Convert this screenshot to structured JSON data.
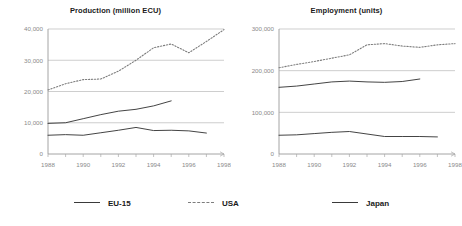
{
  "legend": {
    "items": [
      {
        "label": "EU-15",
        "style": "solid",
        "color": "#3a3a3a"
      },
      {
        "label": "USA",
        "style": "dotted",
        "color": "#7d7d7d"
      },
      {
        "label": "Japan",
        "style": "solid",
        "color": "#3a3a3a"
      }
    ]
  },
  "chart_data": [
    {
      "type": "line",
      "title": "Production (million ECU)",
      "xlabel": "",
      "ylabel": "",
      "xlim": [
        1988,
        1998
      ],
      "ylim": [
        0,
        40000
      ],
      "yticks": [
        0,
        10000,
        20000,
        30000,
        40000
      ],
      "ytick_labels": [
        "0",
        "10,000",
        "20,000",
        "30,000",
        "40,000"
      ],
      "xticks": [
        1988,
        1990,
        1992,
        1994,
        1996,
        1998
      ],
      "xtick_labels": [
        "1988",
        "1990",
        "1992",
        "1994",
        "1996",
        "1998"
      ],
      "grid": true,
      "legend_position": "bottom",
      "series": [
        {
          "name": "EU-15",
          "style": "solid",
          "color": "#3a3a3a",
          "x": [
            1988,
            1989,
            1990,
            1991,
            1992,
            1993,
            1994,
            1995
          ],
          "values": [
            9800,
            10000,
            11300,
            12600,
            13700,
            14300,
            15400,
            17000
          ]
        },
        {
          "name": "USA",
          "style": "dotted",
          "color": "#7d7d7d",
          "x": [
            1988,
            1989,
            1990,
            1991,
            1992,
            1993,
            1994,
            1995,
            1996,
            1997,
            1998
          ],
          "values": [
            20500,
            22500,
            23800,
            24000,
            26500,
            30000,
            34000,
            35200,
            32400,
            36000,
            39800
          ]
        },
        {
          "name": "Japan",
          "style": "solid",
          "color": "#3a3a3a",
          "x": [
            1988,
            1989,
            1990,
            1991,
            1992,
            1993,
            1994,
            1995,
            1996,
            1997
          ],
          "values": [
            6000,
            6200,
            6000,
            6800,
            7600,
            8500,
            7500,
            7600,
            7400,
            6700
          ]
        }
      ]
    },
    {
      "type": "line",
      "title": "Employment (units)",
      "xlabel": "",
      "ylabel": "",
      "xlim": [
        1988,
        1998
      ],
      "ylim": [
        0,
        300000
      ],
      "yticks": [
        0,
        100000,
        200000,
        300000
      ],
      "ytick_labels": [
        "0",
        "100,000",
        "200,000",
        "300,000"
      ],
      "xticks": [
        1988,
        1990,
        1992,
        1994,
        1996,
        1998
      ],
      "xtick_labels": [
        "1988",
        "1990",
        "1992",
        "1994",
        "1996",
        "1998"
      ],
      "grid": true,
      "legend_position": "bottom",
      "series": [
        {
          "name": "EU-15",
          "style": "solid",
          "color": "#3a3a3a",
          "x": [
            1988,
            1989,
            1990,
            1991,
            1992,
            1993,
            1994,
            1995,
            1996
          ],
          "values": [
            160000,
            163000,
            168000,
            173000,
            175000,
            173000,
            172000,
            174000,
            180000
          ]
        },
        {
          "name": "USA",
          "style": "dotted",
          "color": "#7d7d7d",
          "x": [
            1988,
            1989,
            1990,
            1991,
            1992,
            1993,
            1994,
            1995,
            1996,
            1997,
            1998
          ],
          "values": [
            207000,
            215000,
            222000,
            230000,
            238000,
            262000,
            265000,
            259000,
            256000,
            262000,
            265000
          ]
        },
        {
          "name": "Japan",
          "style": "solid",
          "color": "#3a3a3a",
          "x": [
            1988,
            1989,
            1990,
            1991,
            1992,
            1993,
            1994,
            1995,
            1996,
            1997
          ],
          "values": [
            45000,
            46000,
            49000,
            52000,
            54000,
            48000,
            42000,
            42000,
            42000,
            41000
          ]
        }
      ]
    }
  ]
}
